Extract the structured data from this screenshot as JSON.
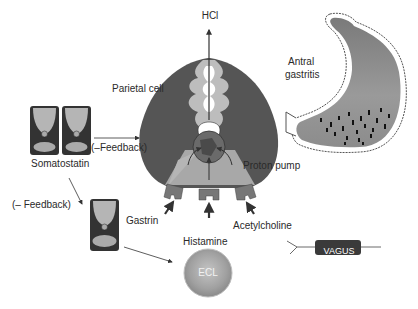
{
  "diagram": {
    "labels": {
      "hcl": "HCl",
      "parietal_cell": "Parietal cell",
      "antral_gastritis_line1": "Antral",
      "antral_gastritis_line2": "gastritis",
      "feedback_top": "(–Feedback)",
      "somatostatin": "Somatostatin",
      "proton_pump": "Proton pump",
      "feedback_left": "(– Feedback)",
      "gastrin": "Gastrin",
      "acetylcholine": "Acetylcholine",
      "histamine": "Histamine",
      "ecl": "ECL",
      "vagus": "VAGUS"
    },
    "colors": {
      "cell_dark": "#555555",
      "cell_light": "#a8a8a8",
      "canaliculus": "#bdbdbd",
      "ecl_fill": "#9e9e9e",
      "vagus_fill": "#3a3a3a",
      "arrow": "#333333"
    }
  }
}
